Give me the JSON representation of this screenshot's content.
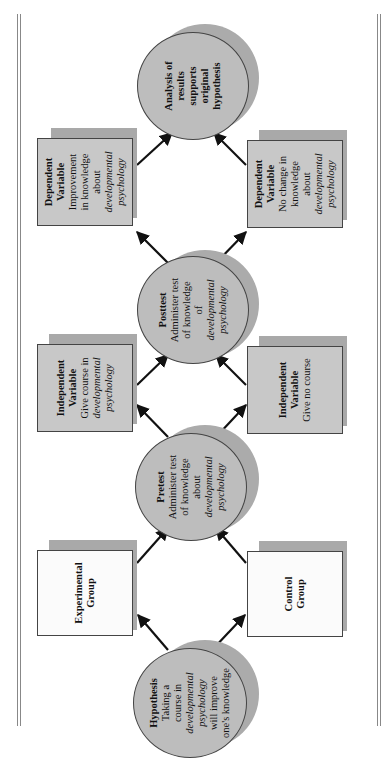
{
  "diagram": {
    "orientation": "rotated 90 degrees counter-clockwise",
    "colors": {
      "box_fill": "#c8c8c8",
      "white_box_fill": "#fbfbfb",
      "circle_fill": "#bdbdbd",
      "shadow": "#a9a9a9",
      "arrow": "#111111"
    },
    "hypothesis": {
      "title": "Hypothesis",
      "lines": [
        "Taking a",
        "course in"
      ],
      "italic": [
        "developmental",
        "psychology"
      ],
      "after": [
        "will improve",
        "one's knowledge"
      ]
    },
    "experimental_group": {
      "title_1": "Experimental",
      "title_2": "Group"
    },
    "control_group": {
      "title_1": "Control",
      "title_2": "Group"
    },
    "pretest": {
      "title": "Pretest",
      "line1": "Administer test",
      "line2": "of knowledge",
      "line3": "about",
      "italic1": "developmental",
      "italic2": "psychology"
    },
    "independent_experimental": {
      "title_1": "Independent",
      "title_2": "Variable",
      "line1": "Give course in",
      "italic1": "developmental",
      "italic2": "psychology"
    },
    "independent_control": {
      "title_1": "Independent",
      "title_2": "Variable",
      "line1": "Give no course"
    },
    "posttest": {
      "title": "Posttest",
      "line1": "Administer test",
      "line2": "of knowledge",
      "line3": "of",
      "italic1": "developmental",
      "italic2": "psychology"
    },
    "dependent_experimental": {
      "title_1": "Dependent",
      "title_2": "Variable",
      "line1": "Improvement",
      "line2": "in knowledge",
      "line3": "about",
      "italic1": "developmental",
      "italic2": "psychology"
    },
    "dependent_control": {
      "title_1": "Dependent",
      "title_2": "Variable",
      "line1": "No change in",
      "line2": "knowledge",
      "line3": "about",
      "italic1": "developmental",
      "italic2": "psychology"
    },
    "analysis": {
      "line1": "Analysis of",
      "line2": "results",
      "line3": "supports",
      "line4": "original",
      "line5": "hypothesis"
    }
  }
}
